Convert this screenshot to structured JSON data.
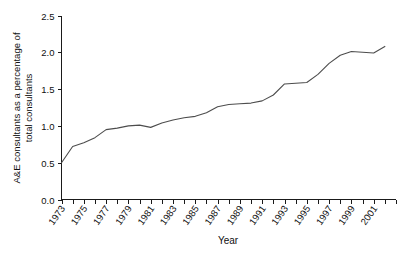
{
  "chart_data": {
    "type": "line",
    "title": "",
    "xlabel": "Year",
    "ylabel": "A&E consultants as a percentage of total consultants",
    "ylabel_line1": "A&E consultants as a percentage of",
    "ylabel_line2": "total consultants",
    "grid": false,
    "legend": "none",
    "xlim": [
      1973,
      2003
    ],
    "ylim": [
      0.0,
      2.5
    ],
    "ytick_labels": [
      "0.0",
      "0.5",
      "1.0",
      "1.5",
      "2.0",
      "2.5"
    ],
    "ytick_values": [
      0.0,
      0.5,
      1.0,
      1.5,
      2.0,
      2.5
    ],
    "xtick_labels": [
      "1973",
      "1975",
      "1977",
      "1979",
      "1981",
      "1983",
      "1985",
      "1987",
      "1989",
      "1991",
      "1993",
      "1995",
      "1997",
      "1999",
      "2001"
    ],
    "xtick_values": [
      1973,
      1975,
      1977,
      1979,
      1981,
      1983,
      1985,
      1987,
      1989,
      1991,
      1993,
      1995,
      1997,
      1999,
      2001
    ],
    "x": [
      1973,
      1974,
      1975,
      1976,
      1977,
      1978,
      1979,
      1980,
      1981,
      1982,
      1983,
      1984,
      1985,
      1986,
      1987,
      1988,
      1989,
      1990,
      1991,
      1992,
      1993,
      1994,
      1995,
      1996,
      1997,
      1998,
      1999,
      2000,
      2001,
      2002
    ],
    "values": [
      0.5,
      0.72,
      0.77,
      0.84,
      0.95,
      0.97,
      1.0,
      1.01,
      0.98,
      1.04,
      1.08,
      1.11,
      1.13,
      1.18,
      1.26,
      1.29,
      1.3,
      1.31,
      1.34,
      1.42,
      1.57,
      1.58,
      1.59,
      1.7,
      1.85,
      1.96,
      2.01,
      2.0,
      1.99,
      2.08
    ],
    "series_name": "A&E consultants percentage"
  }
}
